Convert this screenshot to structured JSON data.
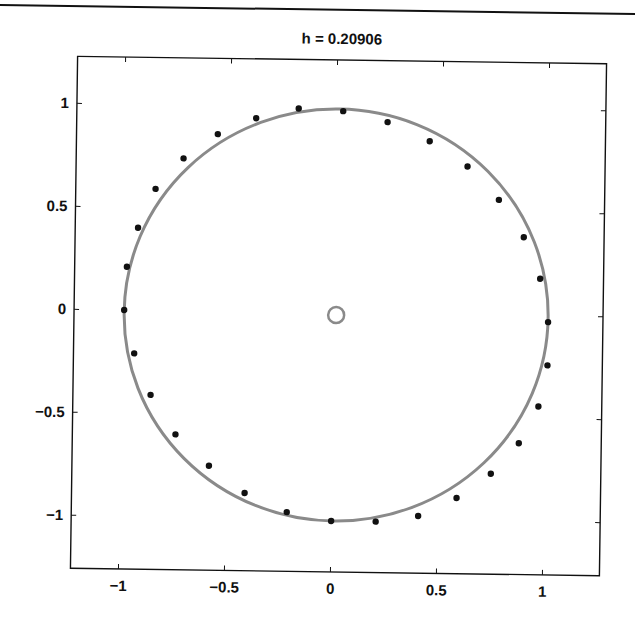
{
  "page": {
    "top_rule_color": "#111111"
  },
  "chart_data": {
    "type": "scatter",
    "title": "h = 0.20906",
    "xlabel": "",
    "ylabel": "",
    "xlim": [
      -1.22,
      1.26
    ],
    "ylim": [
      -1.26,
      1.24
    ],
    "grid": false,
    "legend": null,
    "x_ticks": [
      -1,
      -0.5,
      0,
      0.5,
      1
    ],
    "x_tick_labels": [
      "−1",
      "−0.5",
      "0",
      "0.5",
      "1"
    ],
    "y_ticks": [
      1,
      0.5,
      0,
      -0.5,
      -1
    ],
    "y_tick_labels": [
      "1",
      "0.5",
      "0",
      "−0.5",
      "−1"
    ],
    "series": [
      {
        "name": "points",
        "style": "black filled dots",
        "color": "#111111",
        "x": [
          0.03,
          0.24,
          0.44,
          0.62,
          0.77,
          0.89,
          0.97,
          1.01,
          1.01,
          0.97,
          0.88,
          0.75,
          0.59,
          0.41,
          0.21,
          0.0,
          -0.21,
          -0.41,
          -0.58,
          -0.74,
          -0.86,
          -0.94,
          -0.99,
          -0.98,
          -0.93,
          -0.85,
          -0.72,
          -0.56,
          -0.38,
          -0.18
        ],
        "y": [
          0.98,
          0.93,
          0.84,
          0.72,
          0.56,
          0.38,
          0.18,
          -0.03,
          -0.24,
          -0.44,
          -0.62,
          -0.77,
          -0.89,
          -0.98,
          -1.01,
          -1.01,
          -0.97,
          -0.88,
          -0.75,
          -0.6,
          -0.41,
          -0.21,
          0.0,
          0.21,
          0.4,
          0.59,
          0.74,
          0.86,
          0.94,
          0.99
        ]
      },
      {
        "name": "unit circle",
        "style": "gray line",
        "color": "#8a8a8a",
        "center": [
          0.01,
          -0.01
        ],
        "radius": 1.0
      },
      {
        "name": "center marker",
        "style": "gray open circle",
        "color": "#8a8a8a",
        "x": [
          0.01
        ],
        "y": [
          -0.01
        ]
      }
    ]
  }
}
